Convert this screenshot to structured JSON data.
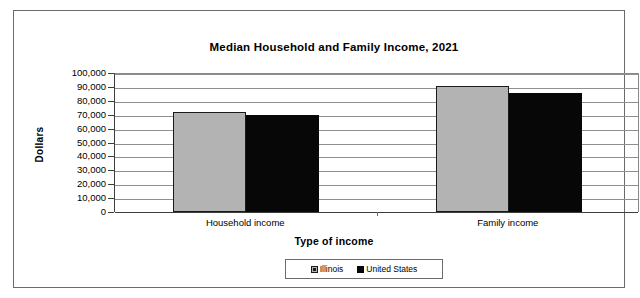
{
  "chart_data": {
    "type": "bar",
    "title": "Median Household and Family Income, 2021",
    "xlabel": "Type of income",
    "ylabel": "Dollars",
    "categories": [
      "Household income",
      "Family income"
    ],
    "series": [
      {
        "name": "Illinois",
        "values": [
          72000,
          91000
        ],
        "color": "#b3b3b3"
      },
      {
        "name": "United States",
        "values": [
          70000,
          85500
        ],
        "color": "#070707"
      }
    ],
    "ylim": [
      0,
      100000
    ],
    "ytick_labels": [
      "100,000",
      "90,000",
      "80,000",
      "70,000",
      "60,000",
      "50,000",
      "40,000",
      "30,000",
      "20,000",
      "10,000",
      "0"
    ],
    "ytick_values": [
      100000,
      90000,
      80000,
      70000,
      60000,
      50000,
      40000,
      30000,
      20000,
      10000,
      0
    ],
    "grid": true,
    "legend_position": "bottom"
  }
}
